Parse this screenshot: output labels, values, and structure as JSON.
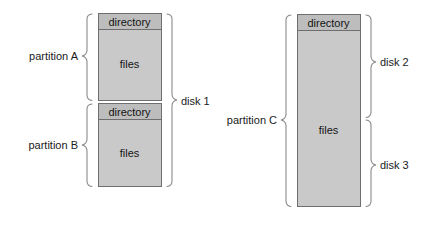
{
  "diagram": {
    "colors": {
      "directory_fill": "#bdbdbd",
      "files_fill": "#c9c9c9",
      "box_stroke": "#6e6e6e",
      "brace_stroke": "#8a8a8a",
      "text": "#141414",
      "background": "#ffffff"
    },
    "disk_groups": [
      {
        "id": "disk-1",
        "label": "disk 1",
        "brace_side": "right",
        "partitions": [
          {
            "id": "partition-a",
            "label": "partition A",
            "brace_side": "left",
            "segments": [
              {
                "id": "partition-a-directory",
                "label": "directory",
                "kind": "directory"
              },
              {
                "id": "partition-a-files",
                "label": "files",
                "kind": "files"
              }
            ]
          },
          {
            "id": "partition-b",
            "label": "partition B",
            "brace_side": "left",
            "segments": [
              {
                "id": "partition-b-directory",
                "label": "directory",
                "kind": "directory"
              },
              {
                "id": "partition-b-files",
                "label": "files",
                "kind": "files"
              }
            ]
          }
        ]
      },
      {
        "id": "disk-2-3",
        "label_top": "disk 2",
        "label_bottom": "disk 3",
        "brace_side": "right",
        "partitions": [
          {
            "id": "partition-c",
            "label": "partition C",
            "brace_side": "left",
            "segments": [
              {
                "id": "partition-c-directory",
                "label": "directory",
                "kind": "directory"
              },
              {
                "id": "partition-c-files",
                "label": "files",
                "kind": "files"
              }
            ]
          }
        ]
      }
    ],
    "labels": {
      "partition_a": "partition A",
      "partition_b": "partition B",
      "partition_c": "partition C",
      "disk_1": "disk 1",
      "disk_2": "disk 2",
      "disk_3": "disk 3",
      "directory_a": "directory",
      "files_a": "files",
      "directory_b": "directory",
      "files_b": "files",
      "directory_c": "directory",
      "files_c": "files"
    }
  }
}
